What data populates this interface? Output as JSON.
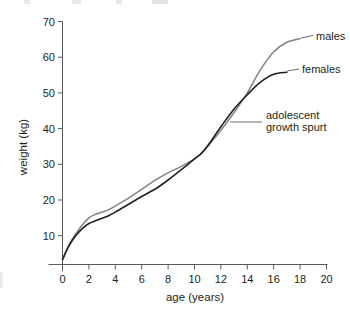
{
  "chart_data": {
    "type": "line",
    "title": "",
    "xlabel": "age (years)",
    "ylabel": "weight (kg)",
    "xlim": [
      -1,
      20.6
    ],
    "ylim": [
      0,
      70
    ],
    "xticks": [
      "0",
      "2",
      "4",
      "6",
      "8",
      "10",
      "12",
      "14",
      "16",
      "18",
      "20"
    ],
    "xtick_values": [
      0,
      2,
      4,
      6,
      8,
      10,
      12,
      14,
      16,
      18,
      20
    ],
    "yticks": [
      "10",
      "20",
      "30",
      "40",
      "50",
      "60",
      "70"
    ],
    "ytick_values": [
      10,
      20,
      30,
      40,
      50,
      60,
      70
    ],
    "grid": false,
    "legend_position": "inline-labels-right",
    "series": [
      {
        "name": "males",
        "color": "#808285",
        "x": [
          0,
          0.5,
          1,
          1.5,
          2,
          2.5,
          3,
          3.5,
          4,
          5,
          6,
          7,
          8,
          9,
          10,
          10.5,
          11,
          12,
          13,
          14,
          15,
          16,
          17,
          18
        ],
        "values": [
          3.4,
          7.5,
          10.5,
          13.0,
          15.0,
          16.0,
          16.6,
          17.3,
          18.3,
          20.5,
          23.0,
          25.5,
          27.6,
          29.4,
          31.5,
          33.0,
          35.0,
          39.5,
          44.5,
          50.0,
          56.5,
          61.5,
          64.2,
          65.2
        ]
      },
      {
        "name": "females",
        "color": "#231f20",
        "x": [
          0,
          0.5,
          1,
          1.5,
          2,
          2.5,
          3,
          3.5,
          4,
          5,
          6,
          7,
          8,
          9,
          10,
          10.5,
          11,
          12,
          13,
          14,
          15,
          16,
          17
        ],
        "values": [
          3.3,
          7.2,
          10.0,
          12.0,
          13.4,
          14.2,
          14.9,
          15.6,
          16.6,
          18.8,
          21.0,
          23.0,
          25.6,
          28.5,
          31.5,
          33.0,
          35.2,
          40.5,
          45.5,
          49.5,
          53.0,
          55.2,
          55.8
        ]
      }
    ],
    "annotations": [
      {
        "text": "males",
        "at_x": 18,
        "at_y": 65
      },
      {
        "text": "females",
        "at_x": 17,
        "at_y": 56
      },
      {
        "text_line1": "adolescent",
        "text_line2": "growth spurt",
        "at_x": 13,
        "at_y": 44
      }
    ]
  },
  "labels": {
    "y_axis_title": "weight (kg)",
    "x_axis_title": "age (years)",
    "males": "males",
    "females": "females",
    "spurt_line1": "adolescent",
    "spurt_line2": "growth spurt",
    "y70": "70",
    "y60": "60",
    "y50": "50",
    "y40": "40",
    "y30": "30",
    "y20": "20",
    "y10": "10",
    "x0": "0",
    "x2": "2",
    "x4": "4",
    "x6": "6",
    "x8": "8",
    "x10": "10",
    "x12": "12",
    "x14": "14",
    "x16": "16",
    "x18": "18",
    "x20": "20"
  },
  "colors": {
    "males_line": "#808285",
    "females_line": "#231f20",
    "axis": "#58595b",
    "text": "#231f20",
    "background": "#ffffff"
  }
}
